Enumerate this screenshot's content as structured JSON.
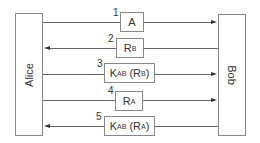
{
  "diagram": {
    "parties": {
      "left": "Alice",
      "right": "Bob"
    },
    "messages": [
      {
        "step": "1",
        "direction": "alice-to-bob",
        "main": "A",
        "sub": "",
        "tail": ""
      },
      {
        "step": "2",
        "direction": "bob-to-alice",
        "main": "R",
        "sub": "B",
        "tail": ""
      },
      {
        "step": "3",
        "direction": "alice-to-bob",
        "main": "K",
        "sub": "AB",
        "tail_main": " (R",
        "tail_sub": "B",
        "tail_end": ")"
      },
      {
        "step": "4",
        "direction": "alice-to-bob",
        "main": "R",
        "sub": "A",
        "tail": ""
      },
      {
        "step": "5",
        "direction": "bob-to-alice",
        "main": "K",
        "sub": "AB",
        "tail_main": " (R",
        "tail_sub": "A",
        "tail_end": ")"
      }
    ],
    "colors": {
      "line": "#666666",
      "box_border": "#888888",
      "text": "#333333"
    }
  }
}
